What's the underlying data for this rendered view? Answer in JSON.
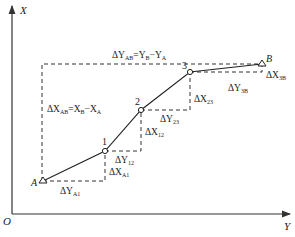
{
  "axes": {
    "x_label": "X",
    "y_label": "Y",
    "origin_label": "O"
  },
  "points": [
    {
      "id": "A",
      "label": "A",
      "x": 43,
      "y": 181,
      "type": "triangle"
    },
    {
      "id": "1",
      "label": "1",
      "x": 105,
      "y": 151,
      "type": "circle"
    },
    {
      "id": "2",
      "label": "2",
      "x": 141,
      "y": 110,
      "type": "circle"
    },
    {
      "id": "3",
      "label": "3",
      "x": 190,
      "y": 72,
      "type": "circle"
    },
    {
      "id": "B",
      "label": "B",
      "x": 262,
      "y": 64,
      "type": "triangle"
    }
  ],
  "labels": {
    "dY_AB": "ΔY",
    "dY_AB_sub": "AB",
    "dY_AB_eq": "=Y",
    "dY_AB_sub2": "B",
    "dY_AB_eq2": "−Y",
    "dY_AB_sub3": "A",
    "dX_AB": "ΔX",
    "dX_AB_sub": "AB",
    "dX_AB_eq": "=X",
    "dX_AB_sub2": "B",
    "dX_AB_eq2": "−X",
    "dX_AB_sub3": "A",
    "dYA1": "ΔY",
    "dYA1_sub": "A1",
    "dXA1": "ΔX",
    "dXA1_sub": "A1",
    "dY12": "ΔY",
    "dY12_sub": "12",
    "dX12": "ΔX",
    "dX12_sub": "12",
    "dY23": "ΔY",
    "dY23_sub": "23",
    "dX23": "ΔX",
    "dX23_sub": "23",
    "dY3B": "ΔY",
    "dY3B_sub": "3B",
    "dX3B": "ΔX",
    "dX3B_sub": "3B"
  }
}
